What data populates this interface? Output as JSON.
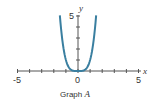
{
  "chart_data": {
    "type": "line",
    "title": "Graph A",
    "title_letter": "A",
    "title_prefix": "Graph ",
    "xlabel": "x",
    "ylabel": "y",
    "xlim": [
      -5,
      5
    ],
    "ylim": [
      0,
      5
    ],
    "x_tick_labels": [
      "-5",
      "0",
      "5"
    ],
    "y_tick_labels": [
      "5"
    ],
    "x_ticks": [
      -5,
      -4,
      -3,
      -2,
      -1,
      0,
      1,
      2,
      3,
      4,
      5
    ],
    "y_ticks": [
      1,
      2,
      3,
      4,
      5
    ],
    "grid": false,
    "series": [
      {
        "name": "y = x^4",
        "color": "#3a7fa0",
        "x": [
          -1.5,
          -1.4,
          -1.3,
          -1.2,
          -1.1,
          -1.0,
          -0.8,
          -0.6,
          -0.4,
          -0.2,
          0,
          0.2,
          0.4,
          0.6,
          0.8,
          1.0,
          1.1,
          1.2,
          1.3,
          1.4,
          1.5
        ],
        "y": [
          5.06,
          3.84,
          2.86,
          2.07,
          1.46,
          1.0,
          0.41,
          0.13,
          0.03,
          0.0,
          0,
          0.0,
          0.03,
          0.13,
          0.41,
          1.0,
          1.46,
          2.07,
          2.86,
          3.84,
          5.06
        ]
      }
    ]
  },
  "colors": {
    "axis": "#555555",
    "curve": "#3a7fa0"
  }
}
